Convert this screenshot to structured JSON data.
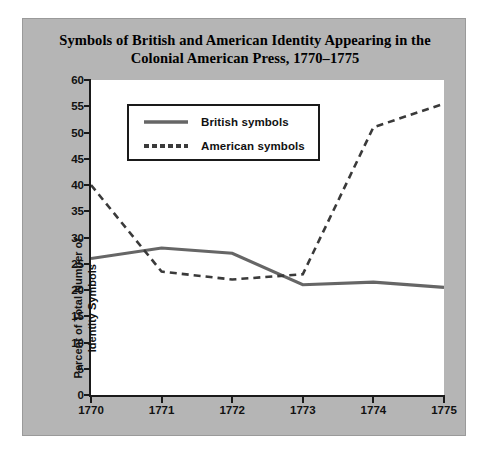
{
  "figure": {
    "background_color": "#b5b5b5",
    "plot_background_color": "#ffffff",
    "axis_color": "#1a1a1a"
  },
  "chart_data": {
    "type": "line",
    "title": "Symbols of British and American Identity Appearing in the Colonial American Press, 1770–1775",
    "title_line1": "Symbols of British and American Identity Appearing in the",
    "title_line2": "Colonial American Press, 1770–1775",
    "xlabel": "",
    "ylabel": "Percent of Total Number of Identity Symbols",
    "ylabel_line1": "Percent of Total Number of",
    "ylabel_line2": "Identity Symbols",
    "categories": [
      "1770",
      "1771",
      "1772",
      "1773",
      "1774",
      "1775"
    ],
    "x": [
      1770,
      1771,
      1772,
      1773,
      1774,
      1775
    ],
    "xlim": [
      1770,
      1775
    ],
    "ylim": [
      0,
      60
    ],
    "yticks": [
      0,
      5,
      10,
      15,
      20,
      25,
      30,
      35,
      40,
      45,
      50,
      55,
      60
    ],
    "ytick_labels": [
      "0",
      "5",
      "10",
      "15",
      "20",
      "25",
      "30",
      "35",
      "40",
      "45",
      "50",
      "55",
      "60"
    ],
    "xticks": [
      1770,
      1771,
      1772,
      1773,
      1774,
      1775
    ],
    "xtick_labels": [
      "1770",
      "1771",
      "1772",
      "1773",
      "1774",
      "1775"
    ],
    "grid": false,
    "legend_position": "upper-left-inside",
    "series": [
      {
        "name": "British symbols",
        "color": "#666666",
        "style": "solid",
        "width": 3.2,
        "values": [
          26,
          28,
          27,
          21,
          21.5,
          20.5
        ]
      },
      {
        "name": "American symbols",
        "color": "#3a3a3a",
        "style": "dashed",
        "width": 2.6,
        "values": [
          40,
          23.5,
          22,
          23,
          51,
          55.5
        ]
      }
    ]
  },
  "legend": {
    "items": [
      {
        "label": "British symbols",
        "style": "solid",
        "color": "#666666"
      },
      {
        "label": "American symbols",
        "style": "dashed",
        "color": "#3a3a3a"
      }
    ]
  }
}
